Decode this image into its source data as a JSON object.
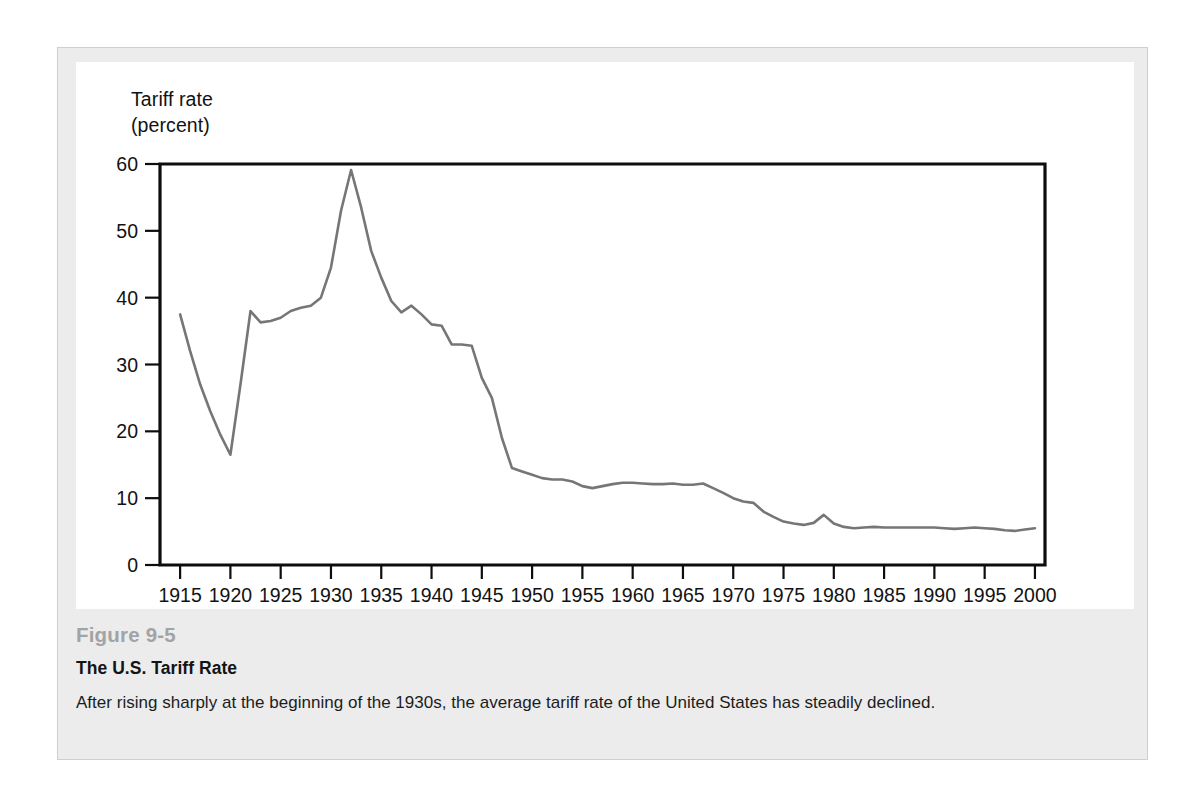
{
  "figure": {
    "number": "Figure 9-5",
    "title": "The U.S. Tariff Rate",
    "description": "After rising sharply at the beginning of the 1930s, the average tariff rate of the United States has steadily declined."
  },
  "colors": {
    "panel_background": "#ececed",
    "plot_background": "#ffffff",
    "axis": "#0d0d0d",
    "line": "#767676",
    "figure_number_text": "#a2a3a5",
    "title_text": "#141414",
    "body_text": "#1c1c1c"
  },
  "chart_data": {
    "type": "line",
    "title": "The U.S. Tariff Rate",
    "ylabel": "Tariff rate\n(percent)",
    "xlabel": "",
    "xlim": [
      1913,
      2001
    ],
    "ylim": [
      0,
      60
    ],
    "yticks": [
      0,
      10,
      20,
      30,
      40,
      50,
      60
    ],
    "xticks": [
      1915,
      1920,
      1925,
      1930,
      1935,
      1940,
      1945,
      1950,
      1955,
      1960,
      1965,
      1970,
      1975,
      1980,
      1985,
      1990,
      1995,
      2000
    ],
    "grid": false,
    "legend": "none",
    "series": [
      {
        "name": "U.S. average tariff rate (percent)",
        "x": [
          1915,
          1916,
          1917,
          1918,
          1919,
          1920,
          1921,
          1922,
          1923,
          1924,
          1925,
          1926,
          1927,
          1928,
          1929,
          1930,
          1931,
          1932,
          1933,
          1934,
          1935,
          1936,
          1937,
          1938,
          1939,
          1940,
          1941,
          1942,
          1943,
          1944,
          1945,
          1946,
          1947,
          1948,
          1949,
          1950,
          1951,
          1952,
          1953,
          1954,
          1955,
          1956,
          1957,
          1958,
          1959,
          1960,
          1961,
          1962,
          1963,
          1964,
          1965,
          1966,
          1967,
          1968,
          1969,
          1970,
          1971,
          1972,
          1973,
          1974,
          1975,
          1976,
          1977,
          1978,
          1979,
          1980,
          1981,
          1982,
          1983,
          1984,
          1985,
          1986,
          1987,
          1988,
          1989,
          1990,
          1991,
          1992,
          1993,
          1994,
          1995,
          1996,
          1997,
          1998,
          1999,
          2000
        ],
        "y": [
          37.5,
          32.0,
          27.0,
          23.0,
          19.5,
          16.5,
          27.0,
          38.0,
          36.3,
          36.5,
          37.0,
          38.0,
          38.5,
          38.8,
          40.0,
          44.5,
          53.0,
          59.1,
          53.5,
          47.0,
          43.0,
          39.5,
          37.8,
          38.8,
          37.5,
          36.0,
          35.8,
          33.0,
          33.0,
          32.8,
          28.0,
          25.0,
          19.0,
          14.5,
          14.0,
          13.5,
          13.0,
          12.8,
          12.8,
          12.5,
          11.8,
          11.5,
          11.8,
          12.1,
          12.3,
          12.3,
          12.2,
          12.1,
          12.1,
          12.2,
          12.0,
          12.0,
          12.2,
          11.5,
          10.8,
          10.0,
          9.5,
          9.3,
          8.0,
          7.2,
          6.5,
          6.2,
          6.0,
          6.3,
          7.5,
          6.2,
          5.7,
          5.5,
          5.6,
          5.7,
          5.6,
          5.6,
          5.6,
          5.6,
          5.6,
          5.6,
          5.5,
          5.4,
          5.5,
          5.6,
          5.5,
          5.4,
          5.2,
          5.1,
          5.3,
          5.5
        ]
      }
    ]
  }
}
